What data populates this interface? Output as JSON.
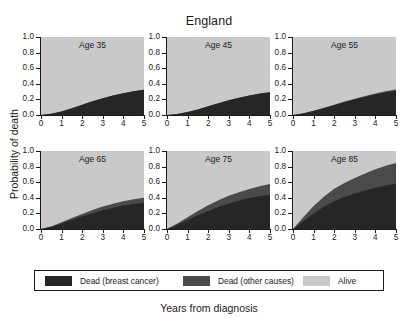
{
  "chart_data": {
    "type": "area",
    "title": "England",
    "xlabel": "Years from diagnosis",
    "ylabel": "Probability of death",
    "xlim": [
      0,
      5
    ],
    "ylim": [
      0,
      1.0
    ],
    "xticks": [
      "0",
      "1",
      "2",
      "3",
      "4",
      "5"
    ],
    "yticks": [
      "1.0",
      "0.8",
      "0.6",
      "0.4",
      "0.2",
      "0.0"
    ],
    "grid": false,
    "legend_position": "bottom",
    "legend": [
      {
        "label": "Dead (breast cancer)",
        "color": "#262626"
      },
      {
        "label": "Dead (other causes)",
        "color": "#4a4a4a"
      },
      {
        "label": "Alive",
        "color": "#c9c9c9"
      }
    ],
    "x": [
      0,
      0.5,
      1,
      1.5,
      2,
      2.5,
      3,
      3.5,
      4,
      4.5,
      5
    ],
    "panels": [
      {
        "label": "Age 35",
        "series": [
          {
            "name": "Dead (breast cancer)",
            "values": [
              0.0,
              0.015,
              0.045,
              0.085,
              0.13,
              0.175,
              0.215,
              0.25,
              0.28,
              0.305,
              0.325
            ]
          },
          {
            "name": "Dead (other causes)",
            "values": [
              0.0,
              0.015,
              0.045,
              0.085,
              0.13,
              0.175,
              0.215,
              0.25,
              0.28,
              0.305,
              0.325
            ]
          }
        ]
      },
      {
        "label": "Age 45",
        "series": [
          {
            "name": "Dead (breast cancer)",
            "values": [
              0.0,
              0.012,
              0.038,
              0.072,
              0.112,
              0.152,
              0.19,
              0.222,
              0.25,
              0.272,
              0.29
            ]
          },
          {
            "name": "Dead (other causes)",
            "values": [
              0.0,
              0.012,
              0.038,
              0.072,
              0.112,
              0.152,
              0.19,
              0.222,
              0.25,
              0.275,
              0.295
            ]
          }
        ]
      },
      {
        "label": "Age 55",
        "series": [
          {
            "name": "Dead (breast cancer)",
            "values": [
              0.0,
              0.02,
              0.052,
              0.088,
              0.125,
              0.162,
              0.198,
              0.232,
              0.262,
              0.288,
              0.31
            ]
          },
          {
            "name": "Dead (other causes)",
            "values": [
              0.0,
              0.022,
              0.056,
              0.094,
              0.133,
              0.172,
              0.209,
              0.244,
              0.276,
              0.303,
              0.326
            ]
          }
        ]
      },
      {
        "label": "Age 65",
        "series": [
          {
            "name": "Dead (breast cancer)",
            "values": [
              0.0,
              0.028,
              0.072,
              0.118,
              0.162,
              0.203,
              0.24,
              0.272,
              0.3,
              0.32,
              0.335
            ]
          },
          {
            "name": "Dead (other causes)",
            "values": [
              0.0,
              0.033,
              0.085,
              0.14,
              0.193,
              0.242,
              0.287,
              0.325,
              0.356,
              0.382,
              0.402
            ]
          }
        ]
      },
      {
        "label": "Age 75",
        "series": [
          {
            "name": "Dead (breast cancer)",
            "values": [
              0.0,
              0.055,
              0.115,
              0.175,
              0.232,
              0.283,
              0.328,
              0.366,
              0.396,
              0.42,
              0.44
            ]
          },
          {
            "name": "Dead (other causes)",
            "values": [
              0.0,
              0.072,
              0.152,
              0.232,
              0.305,
              0.37,
              0.425,
              0.472,
              0.512,
              0.548,
              0.578
            ]
          }
        ]
      },
      {
        "label": "Age 85",
        "series": [
          {
            "name": "Dead (breast cancer)",
            "values": [
              0.0,
              0.1,
              0.2,
              0.285,
              0.355,
              0.41,
              0.455,
              0.495,
              0.53,
              0.558,
              0.582
            ]
          },
          {
            "name": "Dead (other causes)",
            "values": [
              0.0,
              0.15,
              0.295,
              0.415,
              0.515,
              0.59,
              0.655,
              0.71,
              0.765,
              0.81,
              0.845
            ]
          }
        ]
      }
    ]
  }
}
